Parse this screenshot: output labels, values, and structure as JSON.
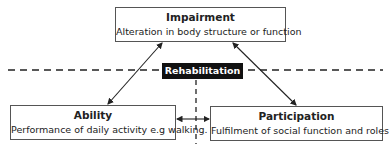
{
  "diagram": {
    "nodes": {
      "impairment": {
        "title": "Impairment",
        "description": "Alteration in body structure or function"
      },
      "ability": {
        "title": "Ability",
        "description": "Performance of daily activity e.g walking."
      },
      "participation": {
        "title": "Participation",
        "description": "Fulfilment of social function and roles"
      }
    },
    "center_label": "Rehabilitation",
    "edges": [
      {
        "from": "impairment",
        "to": "ability",
        "type": "bidirectional-arrow"
      },
      {
        "from": "impairment",
        "to": "participation",
        "type": "bidirectional-arrow"
      },
      {
        "from": "ability",
        "to": "participation",
        "type": "bidirectional-arrow"
      }
    ],
    "divider_lines": [
      "horizontal-dashed",
      "vertical-dashed"
    ],
    "colors": {
      "box_border": "#555555",
      "label_bg": "#111111",
      "label_text": "#ffffff",
      "line": "#222222"
    }
  }
}
